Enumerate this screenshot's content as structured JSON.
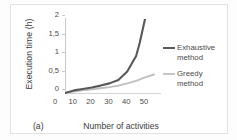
{
  "figure": {
    "caption": "(a)"
  },
  "chart_data": {
    "type": "line",
    "title": "",
    "xlabel": "Number of activities",
    "ylabel": "Execution time (h)",
    "xlim": [
      0,
      55
    ],
    "ylim": [
      0,
      2
    ],
    "xticks": [
      "0",
      "10",
      "20",
      "30",
      "40",
      "50"
    ],
    "xtick_values": [
      0,
      10,
      20,
      30,
      40,
      50
    ],
    "yticks": [
      "0",
      "0,5",
      "1",
      "1,5",
      "2"
    ],
    "ytick_values": [
      0,
      0.5,
      1,
      1.5,
      2
    ],
    "grid": false,
    "legend_position": "right",
    "series": [
      {
        "name": "Exhaustive method",
        "legend_label_line1": "Exhaustive",
        "legend_label_line2": "method",
        "color": "#595959",
        "x": [
          0,
          5,
          10,
          15,
          20,
          25,
          30,
          35,
          40,
          42,
          45
        ],
        "values": [
          0.0,
          0.07,
          0.11,
          0.15,
          0.2,
          0.26,
          0.35,
          0.58,
          1.0,
          1.35,
          2.0
        ]
      },
      {
        "name": "Greedy method",
        "legend_label_line1": "Greedy",
        "legend_label_line2": "method",
        "color": "#bfbfbf",
        "x": [
          0,
          5,
          10,
          15,
          20,
          25,
          30,
          35,
          40,
          45,
          50
        ],
        "values": [
          0.0,
          0.04,
          0.07,
          0.1,
          0.13,
          0.16,
          0.2,
          0.26,
          0.33,
          0.42,
          0.5
        ]
      }
    ]
  }
}
